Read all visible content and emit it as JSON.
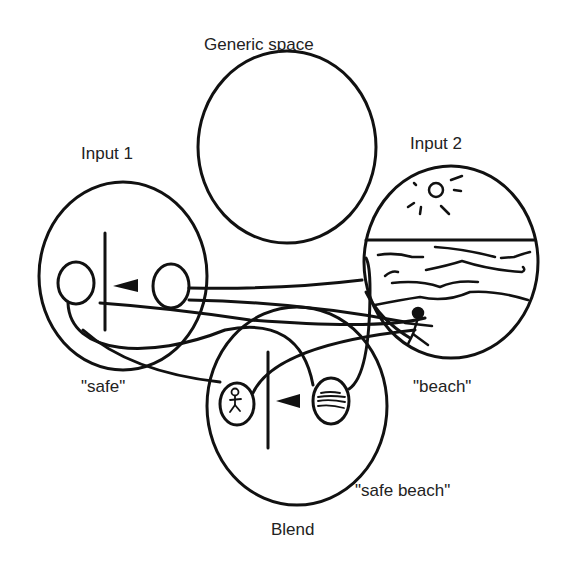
{
  "labels": {
    "generic_space": "Generic space",
    "input1": "Input 1",
    "input2": "Input 2",
    "safe": "\"safe\"",
    "beach": "\"beach\"",
    "safe_beach": "\"safe beach\"",
    "blend": "Blend"
  },
  "colors": {
    "stroke": "#111111",
    "background": "#ffffff",
    "text": "#222222"
  },
  "spaces": [
    {
      "id": "generic",
      "label": "Generic space"
    },
    {
      "id": "input1",
      "label": "Input 1",
      "caption": "\"safe\""
    },
    {
      "id": "input2",
      "label": "Input 2",
      "caption": "\"beach\""
    },
    {
      "id": "blend",
      "label": "Blend",
      "caption": "\"safe beach\""
    }
  ]
}
